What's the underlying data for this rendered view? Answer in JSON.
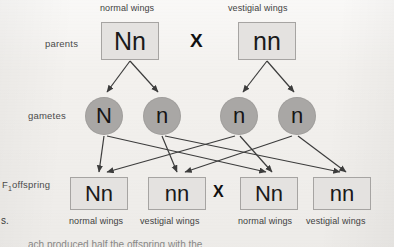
{
  "diagram": {
    "cross_symbol": "X",
    "row_labels": {
      "parents": "parents",
      "gametes": "gametes",
      "f1_offspring_prefix": "F",
      "f1_offspring_subscript": "1",
      "f1_offspring_suffix": "offspring"
    },
    "parents": {
      "captions": [
        "normal wings",
        "vestigial wings"
      ],
      "genotypes": [
        "Nn",
        "nn"
      ]
    },
    "gametes": {
      "alleles": [
        "N",
        "n",
        "n",
        "n"
      ]
    },
    "offspring": {
      "genotypes": [
        "Nn",
        "nn",
        "Nn",
        "nn"
      ],
      "captions": [
        "normal wings",
        "vestigial wings",
        "normal wings",
        "vestigial wings"
      ]
    }
  },
  "page_edge_text": {
    "left_fragment": "s.",
    "bottom_fragment": "ach produced half the offspring with the"
  },
  "colors": {
    "background": "#f3f1ee",
    "box_fill": "#e4e2e0",
    "box_border": "#a6a4a2",
    "circle_fill": "#a9a7a5",
    "arrow": "#3c3c3c",
    "text": "#1a1a1a"
  }
}
